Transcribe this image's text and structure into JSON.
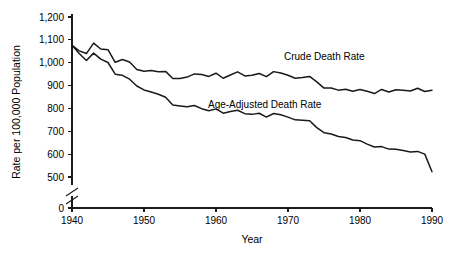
{
  "chart_data": {
    "type": "line",
    "title": "",
    "xlabel": "Year",
    "ylabel": "Rate per 100,000 Population",
    "xlim": [
      1940,
      1990
    ],
    "ylim": [
      0,
      1200
    ],
    "y_axis_break": true,
    "y_break_between": [
      0,
      500
    ],
    "grid": false,
    "legend_position": "inline-annotation",
    "xticks": [
      "1940",
      "1950",
      "1960",
      "1970",
      "1980",
      "1990"
    ],
    "xtick_values": [
      1940,
      1950,
      1960,
      1970,
      1980,
      1990
    ],
    "yticks": [
      "0",
      "500",
      "600",
      "700",
      "800",
      "900",
      "1,000",
      "1,100",
      "1,200"
    ],
    "ytick_values": [
      0,
      500,
      600,
      700,
      800,
      900,
      1000,
      1100,
      1200
    ],
    "x": [
      1940,
      1941,
      1942,
      1943,
      1944,
      1945,
      1946,
      1947,
      1948,
      1949,
      1950,
      1951,
      1952,
      1953,
      1954,
      1955,
      1956,
      1957,
      1958,
      1959,
      1960,
      1961,
      1962,
      1963,
      1964,
      1965,
      1966,
      1967,
      1968,
      1969,
      1970,
      1971,
      1972,
      1973,
      1974,
      1975,
      1976,
      1977,
      1978,
      1979,
      1980,
      1981,
      1982,
      1983,
      1984,
      1985,
      1986,
      1987,
      1988,
      1989,
      1990
    ],
    "series": [
      {
        "name": "Crude Death Rate",
        "label": "Crude Death Rate",
        "color": "#1a1a1a",
        "label_x": 1972,
        "label_y": 1010,
        "values": [
          1076,
          1052,
          1040,
          1086,
          1060,
          1057,
          1002,
          1014,
          1003,
          970,
          963,
          966,
          960,
          962,
          931,
          931,
          937,
          951,
          948,
          940,
          954,
          932,
          946,
          960,
          942,
          945,
          953,
          939,
          961,
          955,
          945,
          932,
          935,
          940,
          916,
          889,
          889,
          880,
          884,
          875,
          883,
          875,
          865,
          883,
          872,
          882,
          879,
          876,
          888,
          874,
          880
        ]
      },
      {
        "name": "Age-Adjusted Death Rate",
        "label": "Age-Adjusted Death Rate",
        "color": "#1a1a1a",
        "label_x": 1960,
        "label_y": 800,
        "values": [
          1076,
          1040,
          1010,
          1042,
          1016,
          1001,
          950,
          945,
          928,
          898,
          881,
          872,
          862,
          849,
          815,
          811,
          807,
          813,
          799,
          790,
          798,
          779,
          787,
          792,
          777,
          774,
          779,
          762,
          778,
          772,
          762,
          750,
          748,
          746,
          716,
          694,
          688,
          677,
          673,
          662,
          659,
          644,
          631,
          633,
          622,
          621,
          616,
          609,
          612,
          600,
          523
        ]
      }
    ]
  },
  "axis": {
    "x_title": "Year",
    "y_title": "Rate per 100,000 Population"
  }
}
